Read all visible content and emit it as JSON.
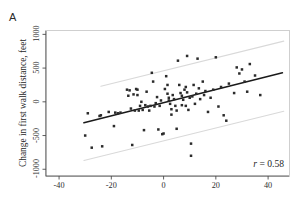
{
  "figure": {
    "panel_label": "A",
    "ylabel": "Change in first walk distance, feet",
    "xlabel": "",
    "annotation": "r = 0.58",
    "annotation_symbol": "r",
    "annotation_value": "= 0.58"
  },
  "colors": {
    "point": "#2b2b2b",
    "fit_line": "#1a1a1a",
    "band_line": "#d9d9d9",
    "frame": "#cfcfcf",
    "axis": "#4d4d4d",
    "text": "#231f20",
    "background": "#ffffff"
  },
  "chart_data": {
    "type": "scatter",
    "title": "",
    "xlabel": "",
    "ylabel": "Change in first walk distance, feet",
    "xlim": [
      -45,
      48
    ],
    "ylim": [
      -1100,
      1050
    ],
    "xticks": [
      -40,
      -20,
      0,
      20,
      40
    ],
    "yticks": [
      -1000,
      -500,
      0,
      500,
      1000
    ],
    "xtick_labels": [
      "-40",
      "-20",
      "0",
      "20",
      "40"
    ],
    "ytick_labels": [
      "-1000",
      "-500",
      "0",
      "500",
      "1000"
    ],
    "grid": false,
    "legend": null,
    "annotations": [
      {
        "text": "r = 0.58",
        "x": 33,
        "y": -830
      }
    ],
    "correlation_r": 0.58,
    "fit_line": {
      "type": "linear-regression",
      "x_start": -30.5,
      "y_start": -310,
      "x_end": 45.5,
      "y_end": 430,
      "slope": 9.74,
      "intercept": -13
    },
    "bands": [
      {
        "name": "upper-prediction-band",
        "x_start": -24.0,
        "y_start": 230,
        "x_end": 46.0,
        "y_end": 900
      },
      {
        "name": "lower-prediction-band",
        "x_start": -30.5,
        "y_start": -870,
        "x_end": 46.0,
        "y_end": -140
      }
    ],
    "points": [
      [
        -30.0,
        -500
      ],
      [
        -29.0,
        -170
      ],
      [
        -27.5,
        -680
      ],
      [
        -24.5,
        -210
      ],
      [
        -24.0,
        -200
      ],
      [
        -23.5,
        -660
      ],
      [
        -21.0,
        -150
      ],
      [
        -19.0,
        -360
      ],
      [
        -18.5,
        -160
      ],
      [
        -17.5,
        -170
      ],
      [
        -16.5,
        -160
      ],
      [
        -14.0,
        180
      ],
      [
        -13.5,
        90
      ],
      [
        -13.0,
        170
      ],
      [
        -12.5,
        -100
      ],
      [
        -12.0,
        -640
      ],
      [
        -11.5,
        110
      ],
      [
        -11.0,
        -130
      ],
      [
        -10.5,
        190
      ],
      [
        -10.0,
        180
      ],
      [
        -10.0,
        100
      ],
      [
        -9.5,
        -130
      ],
      [
        -9.0,
        -60
      ],
      [
        -8.5,
        0
      ],
      [
        -8.0,
        -120
      ],
      [
        -7.5,
        -420
      ],
      [
        -7.0,
        -50
      ],
      [
        -6.5,
        150
      ],
      [
        -6.0,
        -70
      ],
      [
        -5.5,
        -130
      ],
      [
        -5.0,
        -60
      ],
      [
        -4.5,
        430
      ],
      [
        -4.0,
        300
      ],
      [
        -3.5,
        -70
      ],
      [
        -3.0,
        -20
      ],
      [
        -2.5,
        70
      ],
      [
        -2.0,
        -410
      ],
      [
        -1.5,
        -60
      ],
      [
        -1.0,
        20
      ],
      [
        -0.5,
        -480
      ],
      [
        0.0,
        -470
      ],
      [
        0.5,
        190
      ],
      [
        1.0,
        380
      ],
      [
        1.5,
        250
      ],
      [
        1.5,
        120
      ],
      [
        2.0,
        60
      ],
      [
        2.0,
        20
      ],
      [
        2.5,
        -30
      ],
      [
        3.0,
        -110
      ],
      [
        3.0,
        -190
      ],
      [
        3.5,
        100
      ],
      [
        4.0,
        40
      ],
      [
        4.5,
        -60
      ],
      [
        5.0,
        -130
      ],
      [
        5.0,
        -400
      ],
      [
        5.5,
        610
      ],
      [
        6.0,
        250
      ],
      [
        6.5,
        130
      ],
      [
        7.0,
        90
      ],
      [
        7.0,
        -50
      ],
      [
        7.5,
        30
      ],
      [
        8.0,
        180
      ],
      [
        8.5,
        220
      ],
      [
        8.5,
        -60
      ],
      [
        9.0,
        680
      ],
      [
        9.0,
        140
      ],
      [
        9.5,
        -120
      ],
      [
        10.0,
        60
      ],
      [
        10.5,
        -620
      ],
      [
        10.5,
        -800
      ],
      [
        11.0,
        80
      ],
      [
        11.5,
        250
      ],
      [
        12.0,
        -30
      ],
      [
        12.5,
        120
      ],
      [
        13.0,
        640
      ],
      [
        13.5,
        200
      ],
      [
        14.0,
        40
      ],
      [
        15.0,
        300
      ],
      [
        15.5,
        100
      ],
      [
        16.0,
        160
      ],
      [
        17.0,
        -150
      ],
      [
        18.0,
        60
      ],
      [
        19.0,
        180
      ],
      [
        20.0,
        660
      ],
      [
        21.0,
        -70
      ],
      [
        22.0,
        220
      ],
      [
        23.0,
        -200
      ],
      [
        24.0,
        -280
      ],
      [
        25.0,
        270
      ],
      [
        27.0,
        130
      ],
      [
        28.0,
        510
      ],
      [
        29.0,
        420
      ],
      [
        30.0,
        480
      ],
      [
        31.0,
        300
      ],
      [
        32.0,
        150
      ],
      [
        33.0,
        560
      ],
      [
        35.0,
        390
      ],
      [
        37.0,
        100
      ]
    ]
  }
}
